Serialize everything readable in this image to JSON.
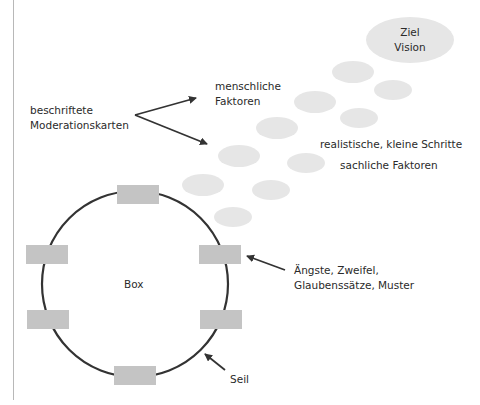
{
  "goal": {
    "line1": "Ziel",
    "line2": "Vision"
  },
  "labels": {
    "cards": {
      "line1": "beschriftete",
      "line2": "Moderationskarten"
    },
    "human": {
      "line1": "menschliche",
      "line2": "Faktoren"
    },
    "steps": "realistische, kleine Schritte",
    "factual": "sachliche Faktoren",
    "box": "Box",
    "fears": {
      "line1": "Ängste, Zweifel,",
      "line2": "Glaubenssätze, Muster"
    },
    "rope": "Seil"
  },
  "colors": {
    "ellipse": "#e6e6e6",
    "card": "#c4c4c4",
    "line": "#333333"
  }
}
